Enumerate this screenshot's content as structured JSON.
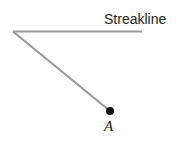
{
  "diagram": {
    "streakline_label": "Streakline",
    "point_label": "A",
    "colors": {
      "line": "#9a9a9a",
      "point": "#111111",
      "text": "#222222"
    }
  }
}
